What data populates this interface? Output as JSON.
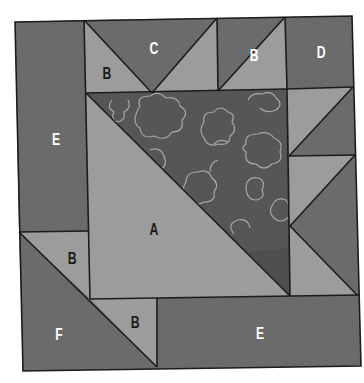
{
  "diagram": {
    "type": "quilt-block-piecing-diagram",
    "colors": {
      "dark": "#6b6b6b",
      "light": "#9c9c9c",
      "print_background": "#565656",
      "print_outline": "#a8a8a8",
      "seam": "#1c1c1c",
      "label_light": "#ffffff",
      "label_dark": "#1a1a1a"
    },
    "labels": {
      "left_strip": "E",
      "top_left_triangle": "B",
      "top_center_triangle": "C",
      "top_right_triangle": "B",
      "top_right_square": "D",
      "center_triangle": "A",
      "lower_left_triangle": "B",
      "bottom_left_triangle": "F",
      "bottom_small_triangle": "B",
      "bottom_strip": "E"
    },
    "pieces": [
      {
        "id": "E-left",
        "label": "E",
        "shade": "dark"
      },
      {
        "id": "B-top-left",
        "label": "B",
        "shade": "light"
      },
      {
        "id": "C-top",
        "label": "C",
        "shade": "dark"
      },
      {
        "id": "B-top-right",
        "label": "B",
        "shade": "light"
      },
      {
        "id": "D-corner",
        "label": "D",
        "shade": "dark"
      },
      {
        "id": "A-center",
        "label": "A",
        "shade": "light"
      },
      {
        "id": "print-center",
        "label": "",
        "shade": "print"
      },
      {
        "id": "B-lower-left",
        "label": "B",
        "shade": "light"
      },
      {
        "id": "F-corner",
        "label": "F",
        "shade": "dark"
      },
      {
        "id": "B-bottom",
        "label": "B",
        "shade": "light"
      },
      {
        "id": "E-bottom",
        "label": "E",
        "shade": "dark"
      }
    ]
  }
}
